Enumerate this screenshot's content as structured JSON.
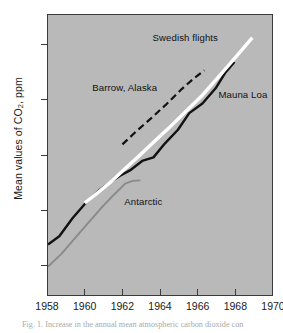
{
  "figure": {
    "caption": "Fig. 1. Increase in the annual mean atmospheric carbon dioxide con"
  },
  "chart_data": {
    "type": "line",
    "title": "",
    "xlabel": "",
    "ylabel": "Mean values of CO2, ppm",
    "ylabel_parts": {
      "prefix": "Mean values of CO",
      "sub": "2",
      "suffix": ", ppm"
    },
    "xlim": [
      1958,
      1970
    ],
    "ylim": [
      310.9,
      321.1
    ],
    "xticks": [
      1958,
      1960,
      1962,
      1964,
      1966,
      1968,
      1970
    ],
    "xtick_labels": [
      "1958",
      "1960",
      "1962",
      "1964",
      "1966",
      "1968",
      "1970"
    ],
    "yticks": [
      312,
      314,
      316,
      318,
      320
    ],
    "ytick_labels": [
      "312",
      "314",
      "316",
      "318",
      "320"
    ],
    "grid": false,
    "legend_position": "inline-annotations",
    "background_color": "#b9b9b9",
    "axis_color": "#3a3a3a",
    "series": [
      {
        "name": "Mauna Loa",
        "color": "#121212",
        "style": "solid",
        "width": 2.4,
        "label": "Mauna Loa",
        "label_x": 1967.05,
        "label_y": 318.22,
        "x": [
          1958.0,
          1958.6,
          1959.3,
          1960.0,
          1960.7,
          1961.3,
          1961.8,
          1962.4,
          1963.0,
          1963.6,
          1964.2,
          1964.9,
          1965.5,
          1966.2,
          1966.9,
          1967.4,
          1967.9
        ],
        "y": [
          312.8,
          313.1,
          313.75,
          314.3,
          314.75,
          315.05,
          315.28,
          315.5,
          315.82,
          315.95,
          316.45,
          316.95,
          317.55,
          317.9,
          318.45,
          319.0,
          319.4
        ]
      },
      {
        "name": "Antarctic",
        "color": "#8a8a8a",
        "style": "solid",
        "width": 1.9,
        "label": "Antarctic",
        "label_x": 1962.05,
        "label_y": 314.32,
        "x": [
          1958.0,
          1958.7,
          1959.4,
          1960.1,
          1960.8,
          1961.5,
          1962.1,
          1962.5,
          1962.9
        ],
        "y": [
          312.0,
          312.45,
          313.0,
          313.55,
          314.1,
          314.6,
          315.0,
          315.1,
          315.12
        ]
      },
      {
        "name": "Swedish flights",
        "color": "#ffffff",
        "style": "solid",
        "width": 3.4,
        "label": "Swedish flights",
        "label_x": 1963.55,
        "label_y": 320.28,
        "x": [
          1959.95,
          1960.6,
          1961.4,
          1962.1,
          1962.8,
          1963.6,
          1964.4,
          1965.3,
          1966.2,
          1967.1,
          1968.0,
          1968.85
        ],
        "y": [
          314.3,
          314.65,
          315.1,
          315.55,
          315.98,
          316.5,
          317.0,
          317.6,
          318.2,
          318.9,
          319.6,
          320.28
        ]
      },
      {
        "name": "Barrow, Alaska",
        "color": "#121212",
        "style": "dashed",
        "dash": "7,4",
        "width": 2.2,
        "label": "Barrow, Alaska",
        "label_x": 1960.35,
        "label_y": 318.45,
        "x": [
          1961.95,
          1962.7,
          1963.5,
          1964.3,
          1965.1,
          1965.7,
          1966.3
        ],
        "y": [
          316.42,
          316.9,
          317.38,
          317.88,
          318.42,
          318.78,
          319.1
        ]
      }
    ]
  }
}
